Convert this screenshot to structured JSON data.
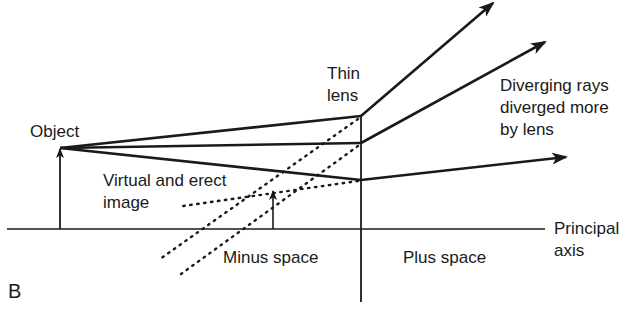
{
  "figure": {
    "panel_label": "B",
    "labels": {
      "object": "Object",
      "thin_lens_line1": "Thin",
      "thin_lens_line2": "lens",
      "diverging_line1": "Diverging rays",
      "diverging_line2": "diverged more",
      "diverging_line3": "by lens",
      "virtual_line1": "Virtual and erect",
      "virtual_line2": "image",
      "minus_space": "Minus space",
      "plus_space": "Plus space",
      "principal_line1": "Principal",
      "principal_line2": "axis"
    },
    "colors": {
      "ink": "#1a1a1a",
      "background": "#ffffff"
    }
  }
}
